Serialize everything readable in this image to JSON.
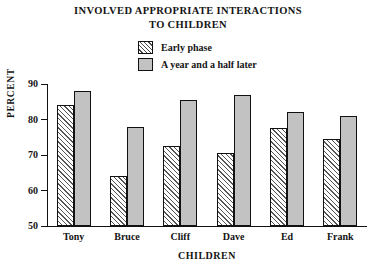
{
  "chart_data": {
    "type": "bar",
    "title": "INVOLVED APPROPRIATE INTERACTIONS TO CHILDREN",
    "title_lines": [
      "INVOLVED APPROPRIATE INTERACTIONS",
      "TO CHILDREN"
    ],
    "xlabel": "CHILDREN",
    "ylabel": "PERCENT",
    "categories": [
      "Tony",
      "Bruce",
      "Cliff",
      "Dave",
      "Ed",
      "Frank"
    ],
    "series": [
      {
        "name": "Early phase",
        "fill": "hatched",
        "values": [
          84,
          64,
          72.5,
          70.5,
          77.5,
          74.5
        ]
      },
      {
        "name": "A year and a half later",
        "fill": "solid-gray",
        "color": "#c2c2c2",
        "values": [
          88,
          78,
          85.5,
          87,
          82,
          81
        ]
      }
    ],
    "ylim": [
      50,
      90
    ],
    "yticks": [
      50,
      60,
      70,
      80,
      90
    ],
    "ytick_labels": [
      "50",
      "60",
      "70",
      "80",
      "90"
    ],
    "grid": false,
    "legend_position": "top-center"
  },
  "legend": {
    "items": [
      {
        "label": "Early phase",
        "swatch": "hatched-swatch-icon"
      },
      {
        "label": "A year and a half later",
        "swatch": "gray-swatch-icon"
      }
    ]
  },
  "axes": {
    "y_title": "PERCENT",
    "x_title": "CHILDREN"
  }
}
